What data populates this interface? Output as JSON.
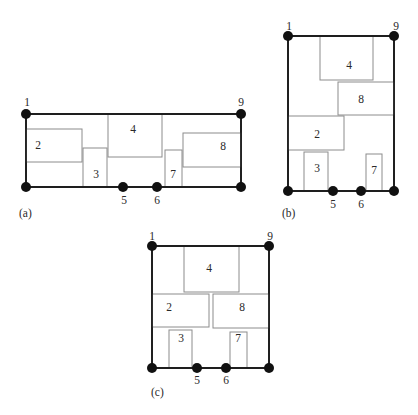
{
  "figure": {
    "panels": [
      {
        "label": "(a)",
        "nodes": {
          "n1": "1",
          "n9": "9",
          "n5": "5",
          "n6": "6"
        },
        "boxes": {
          "b2": "2",
          "b3": "3",
          "b4": "4",
          "b7": "7",
          "b8": "8"
        }
      },
      {
        "label": "(b)",
        "nodes": {
          "n1": "1",
          "n9": "9",
          "n5": "5",
          "n6": "6"
        },
        "boxes": {
          "b2": "2",
          "b3": "3",
          "b4": "4",
          "b7": "7",
          "b8": "8"
        }
      },
      {
        "label": "(c)",
        "nodes": {
          "n1": "1",
          "n9": "9",
          "n5": "5",
          "n6": "6"
        },
        "boxes": {
          "b2": "2",
          "b3": "3",
          "b4": "4",
          "b7": "7",
          "b8": "8"
        }
      }
    ]
  }
}
